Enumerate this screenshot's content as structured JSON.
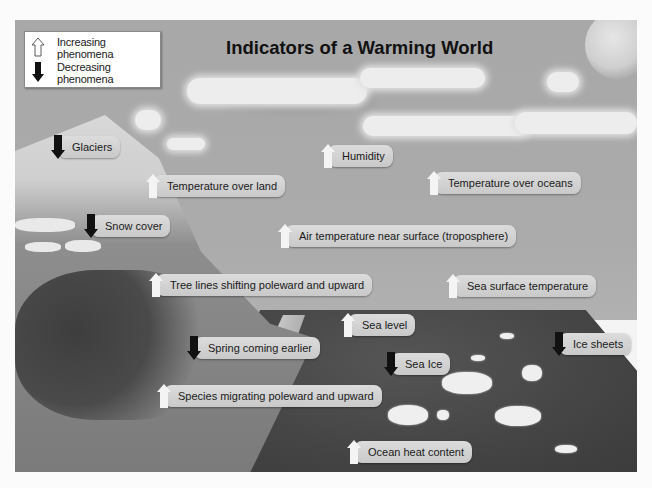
{
  "title": "Indicators of a Warming World",
  "legend": {
    "items": [
      {
        "icon": "up-arrow-icon",
        "direction": "increasing",
        "label": "Increasing phenomena",
        "fill": "#ffffff"
      },
      {
        "icon": "down-arrow-icon",
        "direction": "decreasing",
        "label": "Decreasing phenomena",
        "fill": "#111111"
      }
    ]
  },
  "indicators": [
    {
      "label": "Glaciers",
      "direction": "decreasing",
      "x": 50,
      "y": 134
    },
    {
      "label": "Humidity",
      "direction": "increasing",
      "x": 320,
      "y": 143
    },
    {
      "label": "Temperature over land",
      "direction": "increasing",
      "x": 145,
      "y": 173
    },
    {
      "label": "Temperature over oceans",
      "direction": "increasing",
      "x": 426,
      "y": 170
    },
    {
      "label": "Snow cover",
      "direction": "decreasing",
      "x": 83,
      "y": 213
    },
    {
      "label": "Air temperature near surface (troposphere)",
      "direction": "increasing",
      "x": 277,
      "y": 223
    },
    {
      "label": "Tree lines shifting poleward and upward",
      "direction": "increasing",
      "x": 148,
      "y": 272
    },
    {
      "label": "Sea surface temperature",
      "direction": "increasing",
      "x": 445,
      "y": 273
    },
    {
      "label": "Sea level",
      "direction": "increasing",
      "x": 340,
      "y": 312
    },
    {
      "label": "Ice sheets",
      "direction": "decreasing",
      "x": 551,
      "y": 331
    },
    {
      "label": "Spring coming earlier",
      "direction": "decreasing",
      "x": 186,
      "y": 335
    },
    {
      "label": "Sea Ice",
      "direction": "decreasing",
      "x": 383,
      "y": 351
    },
    {
      "label": "Species migrating poleward and upward",
      "direction": "increasing",
      "x": 156,
      "y": 383
    },
    {
      "label": "Ocean heat content",
      "direction": "increasing",
      "x": 346,
      "y": 439
    }
  ],
  "colors": {
    "sky": "#ababab",
    "sea": "#454545",
    "label_bg": "#d2d2d2",
    "increase_arrow": "#f4f4f4",
    "decrease_arrow": "#111111"
  }
}
